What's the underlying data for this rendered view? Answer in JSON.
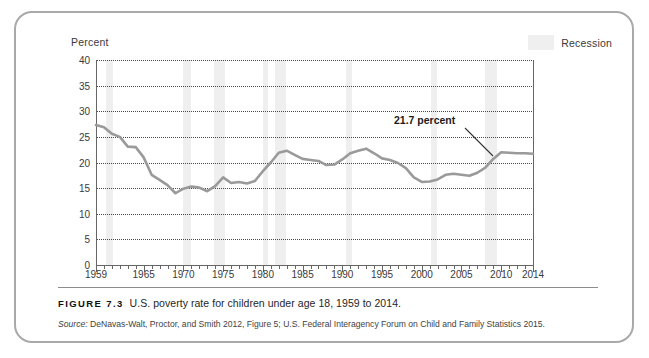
{
  "figure": {
    "caption_label": "FIGURE 7.3",
    "caption_text": "U.S. poverty rate for children under age 18, 1959 to 2014.",
    "source_label": "Source:",
    "source_text": "DeNavas-Walt, Proctor, and Smith 2012, Figure 5; U.S. Federal Interagency Forum on Child and Family Statistics 2015."
  },
  "legend": {
    "recession_label": "Recession",
    "recession_color": "#efefef"
  },
  "chart_data": {
    "type": "line",
    "title": "U.S. poverty rate for children under age 18, 1959 to 2014",
    "xlabel": "",
    "ylabel": "Percent",
    "ylim": [
      0,
      40
    ],
    "xlim": [
      1959,
      2014
    ],
    "yticks": [
      0,
      5,
      10,
      15,
      20,
      25,
      30,
      35,
      40
    ],
    "ytick_labels": [
      "0",
      "5",
      "10",
      "15",
      "20",
      "25",
      "30",
      "35",
      "40"
    ],
    "xticks": [
      1959,
      1965,
      1970,
      1975,
      1980,
      1985,
      1990,
      1995,
      2000,
      2005,
      2010,
      2014
    ],
    "xtick_labels": [
      "1959",
      "1965",
      "1970",
      "1975",
      "1980",
      "1985",
      "1990",
      "1995",
      "2000",
      "2005",
      "2010",
      "2014"
    ],
    "grid": "horizontal-dotted",
    "legend_position": "top-right",
    "line_color": "#9a9a9a",
    "series": [
      {
        "name": "Child poverty rate",
        "x": [
          1959,
          1960,
          1961,
          1962,
          1963,
          1964,
          1965,
          1966,
          1967,
          1968,
          1969,
          1970,
          1971,
          1972,
          1973,
          1974,
          1975,
          1976,
          1977,
          1978,
          1979,
          1980,
          1981,
          1982,
          1983,
          1984,
          1985,
          1986,
          1987,
          1988,
          1989,
          1990,
          1991,
          1992,
          1993,
          1994,
          1995,
          1996,
          1997,
          1998,
          1999,
          2000,
          2001,
          2002,
          2003,
          2004,
          2005,
          2006,
          2007,
          2008,
          2009,
          2010,
          2011,
          2012,
          2013,
          2014
        ],
        "values": [
          27.3,
          26.9,
          25.6,
          25.0,
          23.1,
          23.0,
          21.0,
          17.6,
          16.6,
          15.6,
          14.0,
          14.9,
          15.3,
          15.1,
          14.4,
          15.4,
          17.1,
          16.0,
          16.2,
          15.9,
          16.4,
          18.3,
          20.0,
          21.9,
          22.3,
          21.5,
          20.7,
          20.5,
          20.3,
          19.5,
          19.6,
          20.6,
          21.8,
          22.3,
          22.7,
          21.8,
          20.8,
          20.5,
          19.9,
          18.9,
          17.1,
          16.2,
          16.3,
          16.7,
          17.6,
          17.8,
          17.6,
          17.4,
          18.0,
          19.0,
          20.7,
          22.0,
          21.9,
          21.8,
          21.8,
          21.7
        ]
      }
    ],
    "recession_bands": [
      {
        "start": 1960.3,
        "end": 1961.2
      },
      {
        "start": 1969.9,
        "end": 1970.9
      },
      {
        "start": 1973.9,
        "end": 1975.2
      },
      {
        "start": 1980.0,
        "end": 1980.6
      },
      {
        "start": 1981.5,
        "end": 1982.9
      },
      {
        "start": 1990.5,
        "end": 1991.2
      },
      {
        "start": 2001.2,
        "end": 2001.9
      },
      {
        "start": 2007.9,
        "end": 2009.5
      }
    ],
    "annotations": [
      {
        "text": "21.7 percent",
        "x": 2014,
        "y": 21.7
      }
    ]
  }
}
